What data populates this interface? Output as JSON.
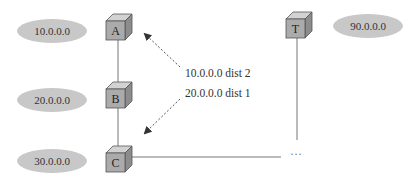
{
  "diagram": {
    "type": "network-topology",
    "colors": {
      "ellipse_fill": "#c8c8c8",
      "cube_front": "#a9a9a9",
      "cube_top": "#d0d0d0",
      "cube_side": "#8a8a8a",
      "line": "#777777",
      "arrow": "#444444"
    },
    "networks": [
      {
        "id": "net-10",
        "label": "10.0.0.0"
      },
      {
        "id": "net-20",
        "label": "20.0.0.0"
      },
      {
        "id": "net-30",
        "label": "30.0.0.0"
      },
      {
        "id": "net-90",
        "label": "90.0.0.0"
      }
    ],
    "routers": [
      {
        "id": "A",
        "label": "A"
      },
      {
        "id": "B",
        "label": "B"
      },
      {
        "id": "C",
        "label": "C"
      },
      {
        "id": "T",
        "label": "T"
      }
    ],
    "links": [
      {
        "from": "A",
        "to": "B"
      },
      {
        "from": "B",
        "to": "C"
      },
      {
        "from": "C",
        "to": "T",
        "via": "..."
      }
    ],
    "advertisement": {
      "lines": [
        "10.0.0.0 dist 2",
        "20.0.0.0 dist 1"
      ]
    },
    "ellipsis": "···"
  }
}
